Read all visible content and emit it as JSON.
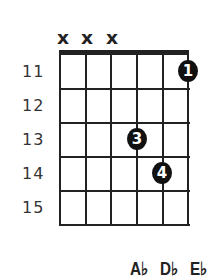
{
  "chord_diagram": {
    "muted_strings": [
      "x",
      "x",
      "x"
    ],
    "fret_numbers": [
      "11",
      "12",
      "13",
      "14",
      "15"
    ],
    "fingers": [
      {
        "finger": "1",
        "string": 6,
        "fret": 11
      },
      {
        "finger": "3",
        "string": 4,
        "fret": 13
      },
      {
        "finger": "4",
        "string": 5,
        "fret": 14
      }
    ],
    "notes": [
      "A♭",
      "D♭",
      "E♭"
    ],
    "colors": {
      "lines": "#222222",
      "dot": "#111111",
      "background": "#ffffff"
    }
  }
}
